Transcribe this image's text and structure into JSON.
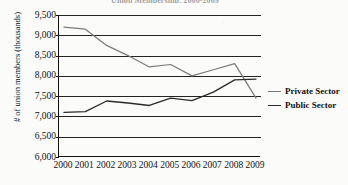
{
  "chart_data": {
    "type": "line",
    "title": "Union Membership, 2000-2009",
    "title_clipped": true,
    "xlabel": "",
    "ylabel": "# of union members (thousands)",
    "categories": [
      "2000",
      "2001",
      "2002",
      "2003",
      "2004",
      "2005",
      "2006",
      "2007",
      "2008",
      "2009"
    ],
    "x": [
      2000,
      2001,
      2002,
      2003,
      2004,
      2005,
      2006,
      2007,
      2008,
      2009
    ],
    "ylim": [
      6000,
      9500
    ],
    "ytick_labels": [
      "9,500",
      "9,000",
      "8,500",
      "8,000",
      "7,500",
      "7,000",
      "6,500",
      "6,000"
    ],
    "ytick_values": [
      9500,
      9000,
      8500,
      8000,
      7500,
      7000,
      6500,
      6000
    ],
    "grid": "horizontal",
    "legend_position": "right",
    "series": [
      {
        "name": "Private Sector",
        "color": "#7c7c7c",
        "values": [
          9200,
          9150,
          8750,
          8500,
          8220,
          8280,
          8000,
          8150,
          8300,
          7450
        ]
      },
      {
        "name": "Public Sector",
        "color": "#2b2b2b",
        "values": [
          7100,
          7120,
          7380,
          7330,
          7270,
          7450,
          7390,
          7600,
          7900,
          7920
        ]
      }
    ]
  }
}
